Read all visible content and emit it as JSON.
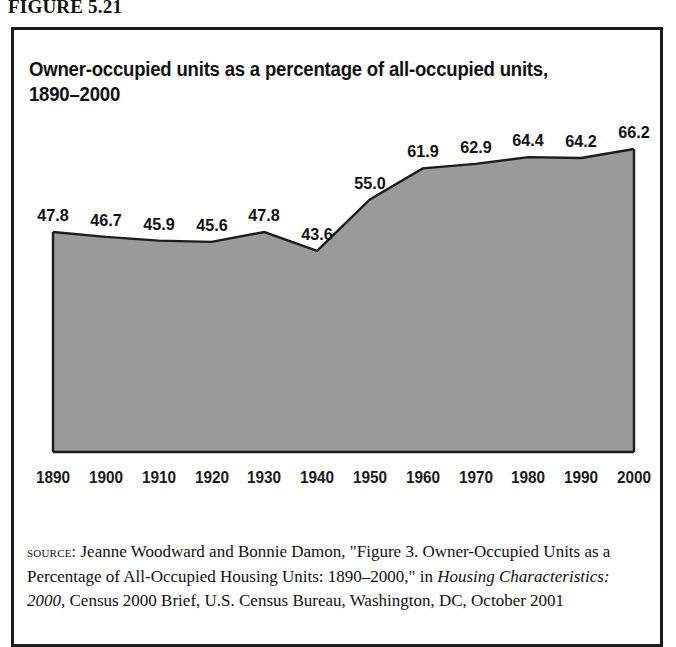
{
  "figure": {
    "label": "FIGURE 5.21",
    "title_line1": "Owner-occupied units as a percentage of all-occupied units,",
    "title_line2": "1890–2000"
  },
  "source": {
    "kicker": "source:",
    "text_part1": " Jeanne Woodward and Bonnie Damon, \"Figure 3. Owner-Occupied Units as a Percentage of All-Occupied Housing Units: 1890–2000,\" in ",
    "italic_title": "Housing Characteristics: 2000,",
    "text_part2": " Census 2000 Brief, U.S. Census Bureau, Washington, DC, October 2001"
  },
  "colors": {
    "area_fill": "#9a9a9a",
    "area_stroke": "#1d1d1d",
    "frame": "#1d1d1d",
    "text": "#111111",
    "background": "#ffffff"
  },
  "chart_data": {
    "type": "area",
    "title": "Owner-occupied units as a percentage of all-occupied units, 1890–2000",
    "xlabel": "",
    "ylabel": "",
    "categories": [
      "1890",
      "1900",
      "1910",
      "1920",
      "1930",
      "1940",
      "1950",
      "1960",
      "1970",
      "1980",
      "1990",
      "2000"
    ],
    "values": [
      47.8,
      46.7,
      45.9,
      45.6,
      47.8,
      43.6,
      55.0,
      61.9,
      62.9,
      64.4,
      64.2,
      66.2
    ],
    "value_labels": [
      "47.8",
      "46.7",
      "45.9",
      "45.6",
      "47.8",
      "43.6",
      "55.0",
      "61.9",
      "62.9",
      "64.4",
      "64.2",
      "66.2"
    ],
    "ylim": [
      0,
      66.2
    ],
    "grid": false,
    "legend": false,
    "axis_visible": {
      "x": true,
      "y": true
    }
  }
}
